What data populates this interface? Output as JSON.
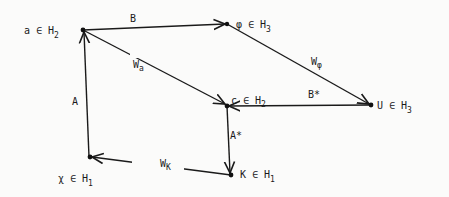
{
  "diagram": {
    "nodes": [
      {
        "id": "a",
        "label": "a ∈ H",
        "sub": "2",
        "x": 83,
        "y": 30
      },
      {
        "id": "phi",
        "label": "φ ∈ H",
        "sub": "3",
        "x": 227,
        "y": 24
      },
      {
        "id": "c",
        "label": "c ∈ H",
        "sub": "2",
        "x": 227,
        "y": 106
      },
      {
        "id": "U",
        "label": "U ∈ H",
        "sub": "3",
        "x": 371,
        "y": 105
      },
      {
        "id": "chi",
        "label": "χ ∈ H",
        "sub": "1",
        "x": 90,
        "y": 157
      },
      {
        "id": "K",
        "label": "K ∈ H",
        "sub": "1",
        "x": 231,
        "y": 175
      }
    ],
    "edges": [
      {
        "from": "a",
        "to": "phi",
        "label": "B"
      },
      {
        "from": "a",
        "to": "c",
        "label": "W",
        "sub": "a"
      },
      {
        "from": "phi",
        "to": "U",
        "label": "W",
        "sub": "φ"
      },
      {
        "from": "U",
        "to": "c",
        "label": "B*"
      },
      {
        "from": "chi",
        "to": "a",
        "label": "A"
      },
      {
        "from": "c",
        "to": "K",
        "label": "A*"
      },
      {
        "from": "K",
        "to": "chi",
        "label": "W",
        "sub": "K"
      }
    ]
  },
  "labels": {
    "a": {
      "main": "a ∈ H",
      "sub": "2"
    },
    "phi": {
      "main": "φ ∈ H",
      "sub": "3"
    },
    "c": {
      "main": "c ∈ H",
      "sub": "2"
    },
    "U": {
      "main": "U ∈ H",
      "sub": "3"
    },
    "chi": {
      "main": "χ ∈ H",
      "sub": "1"
    },
    "K": {
      "main": "K ∈ H",
      "sub": "1"
    },
    "B": "B",
    "Wa": {
      "main": "W",
      "sub": "a"
    },
    "Wphi": {
      "main": "W",
      "sub": "φ"
    },
    "Bstar": "B*",
    "A": "A",
    "Astar": "A*",
    "WK": {
      "main": "W",
      "sub": "K"
    }
  }
}
